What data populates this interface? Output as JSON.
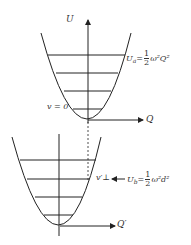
{
  "diagram": {
    "top_well": {
      "y_axis_label": "U",
      "x_axis_label": "Q",
      "level_label": "v = 0",
      "potential_label": {
        "lhs": "U",
        "lhs_sub": "a",
        "eq": "=",
        "num": "1",
        "den": "2",
        "rhs": "ω²Q²"
      }
    },
    "bottom_well": {
      "x_axis_label": "Q′",
      "level_label": "v′⊥",
      "arrow": "←",
      "potential_label": {
        "lhs": "U",
        "lhs_sub": "b",
        "eq": "=",
        "num": "1",
        "den": "2",
        "rhs": "ω²d²"
      }
    },
    "colors": {
      "line": "#222222",
      "text": "#333333"
    }
  }
}
